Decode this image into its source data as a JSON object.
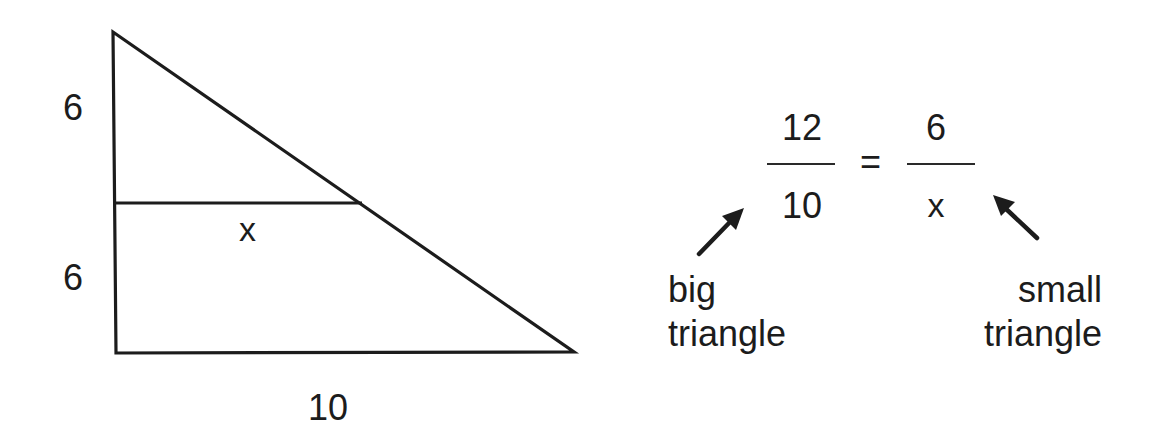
{
  "diagram": {
    "stroke_color": "#1c1c1c",
    "background": "#ffffff",
    "triangle": {
      "vertices": {
        "top": [
          113,
          32
        ],
        "bottom_left": [
          116,
          353
        ],
        "bottom_right": [
          574,
          352
        ]
      },
      "midline": {
        "from": [
          113,
          203
        ],
        "to": [
          362,
          203
        ]
      },
      "labels": {
        "upper_left_side": "6",
        "lower_left_side": "6",
        "midline": "x",
        "base": "10"
      }
    },
    "equation": {
      "left_fraction": {
        "numerator": "12",
        "denominator": "10"
      },
      "equals": "=",
      "right_fraction": {
        "numerator": "6",
        "denominator": "x"
      }
    },
    "annotations": {
      "big": {
        "line1": "big",
        "line2": "triangle",
        "arrow": "arrow-up-right-icon"
      },
      "small": {
        "line1": "small",
        "line2": "triangle",
        "arrow": "arrow-up-left-icon"
      }
    }
  }
}
